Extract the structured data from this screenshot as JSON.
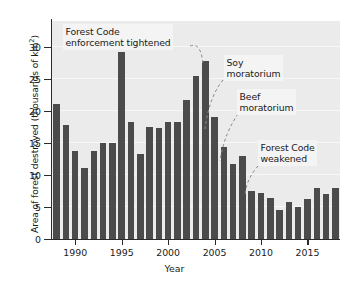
{
  "chart_data": {
    "type": "bar",
    "title": "",
    "xlabel": "Year",
    "ylabel": "Area of forest destroyed (thousands of km²)",
    "ylabel_main": "Area of forest destroyed (thousands of km",
    "ylabel_sup": "2",
    "ylabel_tail": ")",
    "ylim": [
      0,
      34
    ],
    "xlim": [
      1987.4,
      2018.6
    ],
    "grid": true,
    "legend": null,
    "bar_color": "#4b4b4b",
    "plot_background": "#ebebeb",
    "categories": [
      1988,
      1989,
      1990,
      1991,
      1992,
      1993,
      1994,
      1995,
      1996,
      1997,
      1998,
      1999,
      2000,
      2001,
      2002,
      2003,
      2004,
      2005,
      2006,
      2007,
      2008,
      2009,
      2010,
      2011,
      2012,
      2013,
      2014,
      2015,
      2016,
      2017,
      2018
    ],
    "values": [
      21.0,
      17.8,
      13.8,
      11.0,
      13.8,
      14.9,
      14.9,
      29.1,
      18.2,
      13.2,
      17.4,
      17.3,
      18.2,
      18.2,
      21.7,
      25.4,
      27.8,
      19.1,
      14.3,
      11.7,
      13.0,
      7.5,
      7.1,
      6.4,
      4.6,
      5.8,
      5.0,
      6.2,
      8.0,
      7.0,
      8.0
    ],
    "yticks": [
      0,
      5,
      10,
      15,
      20,
      25,
      30
    ],
    "ytick_labels": [
      "0",
      "5",
      "10",
      "15",
      "20",
      "25",
      "30"
    ],
    "xticks": [
      1990,
      1995,
      2000,
      2005,
      2010,
      2015
    ],
    "xtick_labels": [
      "1990",
      "1995",
      "2000",
      "2005",
      "2010",
      "2015"
    ],
    "annotations": [
      {
        "id": "forest-code-enforcement-tightened",
        "text": "Forest Code\nenforcement tightened",
        "x": 63,
        "y": 24,
        "leader": "M 190 46 C 198 43 202 50 203 66"
      },
      {
        "id": "soy-moratorium",
        "text": "Soy\nmoratorium",
        "x": 224,
        "y": 55,
        "leader": "M 223 80 C 216 88 208 104 205 129"
      },
      {
        "id": "beef-moratorium",
        "text": "Beef\nmoratorium",
        "x": 237,
        "y": 89,
        "leader": "M 238 114 C 231 124 223 140 220 161"
      },
      {
        "id": "forest-code-weakened",
        "text": "Forest Code\nweakened",
        "x": 258,
        "y": 140,
        "leader": "M 258 166 C 251 174 246 183 245 196"
      }
    ]
  }
}
